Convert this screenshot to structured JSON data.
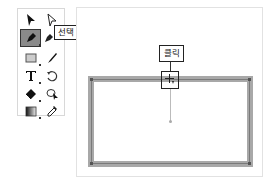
{
  "toolbar": {
    "tools": [
      {
        "name": "selection-tool",
        "icon": "black-arrow-icon"
      },
      {
        "name": "direct-selection-tool",
        "icon": "white-arrow-icon"
      },
      {
        "name": "pen-tool",
        "icon": "pen-icon",
        "selected": true
      },
      {
        "name": "add-anchor-tool",
        "icon": "pen-plus-icon"
      },
      {
        "name": "rectangle-tool",
        "icon": "rectangle-icon"
      },
      {
        "name": "brush-tool",
        "icon": "brush-icon"
      },
      {
        "name": "type-tool",
        "icon": "type-icon"
      },
      {
        "name": "rotate-tool",
        "icon": "rotate-icon"
      },
      {
        "name": "eraser-tool",
        "icon": "eraser-icon"
      },
      {
        "name": "shape-builder-tool",
        "icon": "shape-builder-icon"
      },
      {
        "name": "gradient-tool",
        "icon": "gradient-icon"
      },
      {
        "name": "eyedropper-tool",
        "icon": "eyedropper-icon"
      }
    ],
    "tooltip_label": "선택"
  },
  "canvas": {
    "callout_label": "클릭",
    "rect_stroke_color": "#a8a8a8",
    "path_color": "#7a7a7a"
  }
}
